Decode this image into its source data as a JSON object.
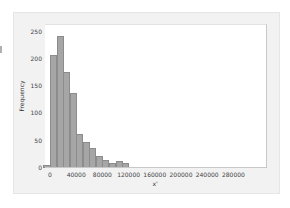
{
  "chart_data": {
    "type": "bar",
    "title": "",
    "xlabel": "x'",
    "ylabel": "Frequency",
    "xlim": [
      -10000,
      325000
    ],
    "ylim": [
      0,
      260
    ],
    "bin_width": 10000,
    "x_ticks": [
      "0",
      "40000",
      "80000",
      "120000",
      "160000",
      "200000",
      "240000",
      "280000"
    ],
    "y_ticks": [
      "0",
      "50",
      "100",
      "150",
      "200",
      "250"
    ],
    "bins_start": [
      -10000,
      0,
      10000,
      20000,
      30000,
      40000,
      50000,
      60000,
      70000,
      80000,
      90000,
      100000,
      110000,
      120000,
      130000,
      140000,
      150000,
      160000,
      170000,
      180000,
      190000,
      200000,
      210000,
      220000,
      230000,
      240000,
      250000,
      260000,
      270000,
      280000,
      290000,
      300000,
      310000
    ],
    "values": [
      5,
      207,
      242,
      176,
      138,
      63,
      47,
      37,
      22,
      15,
      10,
      12,
      9,
      2,
      2,
      1,
      1,
      2,
      1,
      1,
      2,
      2,
      1,
      1,
      1,
      0,
      0,
      2,
      1,
      1,
      1,
      1,
      1
    ],
    "grid": false,
    "legend": null
  }
}
